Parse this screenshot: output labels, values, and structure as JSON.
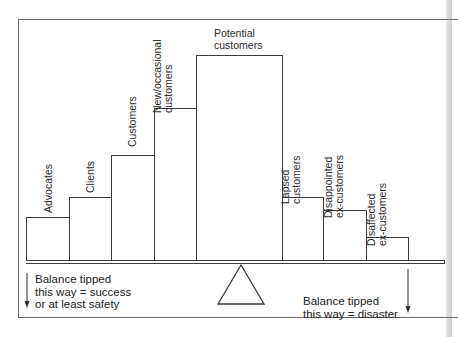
{
  "diagram": {
    "bars": [
      {
        "label": "Advocates",
        "left": 26,
        "right": 69,
        "top": 217
      },
      {
        "label": "Clients",
        "left": 69,
        "right": 111,
        "top": 197
      },
      {
        "label": "Customers",
        "left": 111,
        "right": 154,
        "top": 155
      },
      {
        "label": "New/occasional\ncustomers",
        "left": 154,
        "right": 196,
        "top": 108
      },
      {
        "label": "Potential\ncustomers",
        "left": 196,
        "right": 282,
        "top": 55
      },
      {
        "label": "Lapsed\ncustomers",
        "left": 282,
        "right": 323,
        "top": 197
      },
      {
        "label": "Disappointed\nex-customers",
        "left": 323,
        "right": 366,
        "top": 210
      },
      {
        "label": "Disaffected\nex-customers",
        "left": 366,
        "right": 408,
        "top": 237
      }
    ],
    "labels": {
      "advocates": "Advocates",
      "clients": "Clients",
      "customers": "Customers",
      "new_occasional": "New/occasional\ncustomers",
      "potential": "Potential\ncustomers",
      "lapsed": "Lapsed\ncustomers",
      "disappointed": "Disappointed\nex-customers",
      "disaffected": "Disaffected\nex-customers"
    },
    "left_note": "Balance tipped\nthis way = success\nor at least safety",
    "right_note": "Balance tipped\nthis way = disaster",
    "colors": {
      "line": "#3a3a3a",
      "frame": "#6a6a6a",
      "background": "#ffffff"
    }
  }
}
